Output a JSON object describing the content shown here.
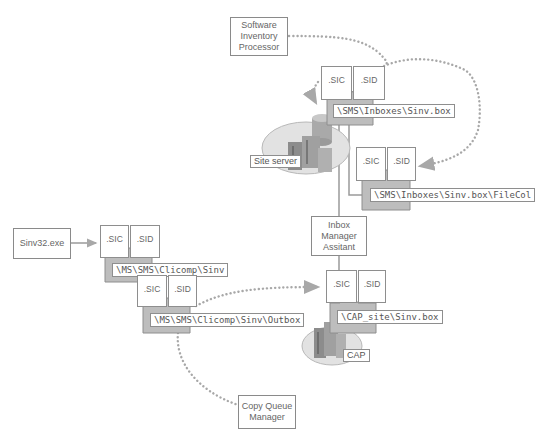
{
  "processes": {
    "software_inventory_processor": "Software Inventory Processor",
    "inbox_manager_assistant": "Inbox Manager Assitant",
    "copy_queue_manager": "Copy Queue Manager",
    "sinv32": "Sinv32.exe"
  },
  "servers": {
    "site_server": "Site server",
    "cap": "CAP"
  },
  "folders": [
    {
      "id": "site-inbox",
      "path": "\\SMS\\Inboxes\\Sinv.box",
      "files": [
        ".SIC",
        ".SID"
      ]
    },
    {
      "id": "site-filecol",
      "path": "\\SMS\\Inboxes\\Sinv.box\\FileCol",
      "files": [
        ".SIC",
        ".SID"
      ]
    },
    {
      "id": "cap-inbox",
      "path": "\\CAP_site\\Sinv.box",
      "files": [
        ".SIC",
        ".SID"
      ]
    },
    {
      "id": "client-sinv",
      "path": "\\MS\\SMS\\Clicomp\\Sinv",
      "files": [
        ".SIC",
        ".SID"
      ]
    },
    {
      "id": "client-outbox",
      "path": "\\MS\\SMS\\Clicomp\\Sinv\\Outbox",
      "files": [
        ".SIC",
        ".SID"
      ]
    }
  ],
  "colors": {
    "line": "#9a9a9a",
    "dotted": "#a8a8a8",
    "folder": "#bdbdbd",
    "folder_edge": "#8e8e8e",
    "server_ellipse": "#e2e2e2"
  }
}
